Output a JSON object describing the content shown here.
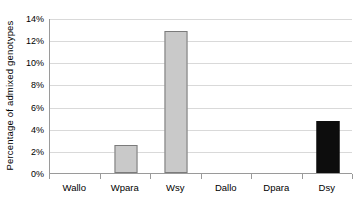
{
  "chart_data": {
    "type": "bar",
    "title": "",
    "subtitle": "",
    "xlabel": "",
    "ylabel": "Percentage of admixed genotypes",
    "categories": [
      "Wallo",
      "Wpara",
      "Wsy",
      "Dallo",
      "Dpara",
      "Dsy"
    ],
    "values": [
      0,
      2.5,
      12.8,
      0,
      0,
      4.7
    ],
    "value_labels": [
      "0%",
      "2.5%",
      "12.8%",
      "0%",
      "0%",
      "4.7%"
    ],
    "series": [
      {
        "name": "Percentage of admixed genotypes",
        "values": [
          0,
          2.5,
          12.8,
          0,
          0,
          4.7
        ]
      }
    ],
    "bar_colors": [
      "#c9c9c9",
      "#c9c9c9",
      "#c9c9c9",
      "#c9c9c9",
      "#c9c9c9",
      "#0d0d0d"
    ],
    "bar_border_colors": [
      "#7b7b7b",
      "#7b7b7b",
      "#7b7b7b",
      "#7b7b7b",
      "#7b7b7b",
      "#0d0d0d"
    ],
    "ylim": [
      0,
      14
    ],
    "ytick_values": [
      0,
      2,
      4,
      6,
      8,
      10,
      12,
      14
    ],
    "ytick_labels": [
      "0%",
      "2%",
      "4%",
      "6%",
      "8%",
      "10%",
      "12%",
      "14%"
    ],
    "grid": true,
    "grid_axis": "y",
    "grid_color": "#d9d9d9",
    "legend": false,
    "legend_position": "none",
    "axis_color": "#9a9a9a",
    "background_color": "#ffffff",
    "text_color": "#000000"
  }
}
